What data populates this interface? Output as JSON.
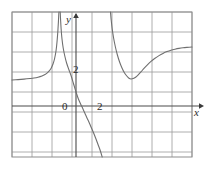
{
  "figure": {
    "kind": "cartesian-graph",
    "width": 207,
    "height": 169,
    "background": "#ffffff",
    "frame": {
      "left": 12,
      "top": 12,
      "right": 192,
      "bottom": 157,
      "border_color": "#8d8d8d",
      "border_width": 1
    },
    "grid": {
      "visible": true,
      "color": "#9a9a9a",
      "line_width": 0.8,
      "cell_px": 20,
      "x_lines": [
        12,
        32,
        52,
        72,
        92,
        112,
        132,
        152,
        172,
        192
      ],
      "y_lines": [
        12,
        32,
        52,
        72,
        92,
        112,
        132,
        152
      ]
    },
    "axes": {
      "color": "#4a4a4a",
      "line_width": 1.1,
      "x_axis_y_px": 106,
      "y_axis_x_px": 76,
      "x_axis_label": "x",
      "y_axis_label": "y",
      "x_arrow": true,
      "y_arrow": true
    },
    "ticks": {
      "y": [
        {
          "label": "2",
          "value": 2,
          "y_px": 69
        }
      ],
      "x": [
        {
          "label": "0",
          "value": 0,
          "x_px": 67
        },
        {
          "label": "2",
          "value": 2,
          "x_px": 101
        }
      ]
    }
  },
  "chart_data": {
    "type": "line",
    "title": "",
    "xlabel": "x",
    "ylabel": "y",
    "grid": true,
    "legend": false,
    "xlim": [
      -3.2,
      5.8
    ],
    "ylim": [
      -2.6,
      4.6
    ],
    "x_ticks": [
      0,
      2
    ],
    "y_ticks": [
      2
    ],
    "asymptotes": {
      "vertical": [
        {
          "x": -0.85,
          "x_px": 59
        },
        {
          "x": 1.7,
          "x_px": 110
        }
      ],
      "horizontal": [
        {
          "y": 1.3,
          "y_px": 80,
          "side": "left"
        },
        {
          "y": 1.75,
          "y_px": 72,
          "side": "right"
        }
      ]
    },
    "features": {
      "y_intercept": {
        "x": 0,
        "y": 1.0,
        "x_px": 76,
        "y_px": 92
      },
      "x_intercept": {
        "x": 0.3,
        "y": 0,
        "x_px": 82,
        "y_px": 106
      },
      "local_minimum": {
        "x": 2.7,
        "y": 0.6,
        "x_px": 130,
        "y_px": 79
      }
    },
    "series": [
      {
        "name": "left-branch",
        "color": "#6f6f6f",
        "points_px": [
          [
            12,
            80
          ],
          [
            18,
            79.6
          ],
          [
            24,
            79.1
          ],
          [
            30,
            78.5
          ],
          [
            34,
            78.0
          ],
          [
            38,
            77.2
          ],
          [
            42,
            76.0
          ],
          [
            45,
            74.6
          ],
          [
            47,
            73.2
          ],
          [
            49,
            71.2
          ],
          [
            51,
            68.4
          ],
          [
            53,
            64.0
          ],
          [
            54.5,
            59.0
          ],
          [
            56,
            51.0
          ],
          [
            57,
            42.0
          ],
          [
            57.8,
            32.0
          ],
          [
            58.4,
            22.0
          ],
          [
            58.8,
            14.0
          ],
          [
            59.0,
            12.0
          ]
        ]
      },
      {
        "name": "middle-branch",
        "color": "#6f6f6f",
        "points_px": [
          [
            60.2,
            12.0
          ],
          [
            60.6,
            20.0
          ],
          [
            61.2,
            30.0
          ],
          [
            62.0,
            39.0
          ],
          [
            63.2,
            48.0
          ],
          [
            64.8,
            56.0
          ],
          [
            66.6,
            63.0
          ],
          [
            68.8,
            69.5
          ],
          [
            71.2,
            76.0
          ],
          [
            73.6,
            84.0
          ],
          [
            76.0,
            92.0
          ],
          [
            78.4,
            99.0
          ],
          [
            80.6,
            104.0
          ],
          [
            83.0,
            109.0
          ],
          [
            85.4,
            114.5
          ],
          [
            88.0,
            120.0
          ],
          [
            90.6,
            126.0
          ],
          [
            93.2,
            132.0
          ],
          [
            95.8,
            138.5
          ],
          [
            98.2,
            145.0
          ],
          [
            100.4,
            151.0
          ],
          [
            102.2,
            157.0
          ]
        ]
      },
      {
        "name": "right-branch",
        "color": "#6f6f6f",
        "points_px": [
          [
            110.5,
            12.0
          ],
          [
            111.2,
            20.0
          ],
          [
            112.2,
            29.0
          ],
          [
            113.6,
            38.0
          ],
          [
            115.4,
            47.0
          ],
          [
            117.4,
            55.0
          ],
          [
            119.6,
            62.0
          ],
          [
            122.0,
            68.0
          ],
          [
            124.4,
            72.8
          ],
          [
            126.8,
            76.0
          ],
          [
            129.0,
            78.2
          ],
          [
            131.0,
            79.0
          ],
          [
            133.2,
            78.6
          ],
          [
            135.6,
            77.2
          ],
          [
            138.2,
            74.8
          ],
          [
            141.0,
            71.8
          ],
          [
            144.0,
            68.4
          ],
          [
            147.4,
            64.8
          ],
          [
            151.0,
            61.4
          ],
          [
            155.0,
            58.2
          ],
          [
            159.0,
            55.6
          ],
          [
            163.0,
            53.4
          ],
          [
            167.0,
            51.6
          ],
          [
            171.0,
            50.2
          ],
          [
            175.0,
            49.2
          ],
          [
            179.0,
            48.4
          ],
          [
            183.0,
            47.8
          ],
          [
            187.0,
            47.4
          ],
          [
            192.0,
            47.0
          ]
        ]
      }
    ]
  }
}
